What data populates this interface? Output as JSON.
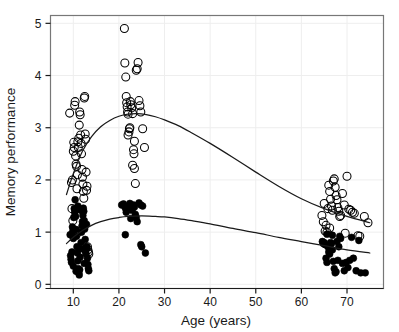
{
  "chart_data": {
    "type": "scatter",
    "title": "",
    "xlabel": "Age (years)",
    "ylabel": "Memory performance",
    "xlim": [
      5,
      78
    ],
    "ylim": [
      -0.08,
      5.15
    ],
    "xticks": [
      10,
      20,
      30,
      40,
      50,
      60,
      70
    ],
    "yticks": [
      0,
      1,
      2,
      3,
      4,
      5
    ],
    "grid": true,
    "legend": "none",
    "background": "#ffffff",
    "frame_color": "#777777",
    "grid_color": "#eeeeee",
    "marker_color": "#000000",
    "curve_color": "#1a1a1a",
    "series": [
      {
        "name": "open-circles",
        "marker": "open-circle",
        "marker_size": 4.0,
        "points": [
          [
            9.2,
            3.28
          ],
          [
            9.6,
            1.95
          ],
          [
            9.7,
            1.45
          ],
          [
            9.8,
            2.0
          ],
          [
            9.9,
            1.22
          ],
          [
            10.0,
            2.55
          ],
          [
            10.1,
            2.72
          ],
          [
            10.2,
            2.62
          ],
          [
            10.3,
            3.43
          ],
          [
            10.4,
            3.5
          ],
          [
            10.5,
            2.46
          ],
          [
            10.6,
            2.3
          ],
          [
            10.7,
            2.26
          ],
          [
            10.8,
            1.83
          ],
          [
            10.9,
            2.1
          ],
          [
            11.0,
            2.73
          ],
          [
            11.1,
            2.62
          ],
          [
            11.2,
            2.8
          ],
          [
            11.3,
            3.05
          ],
          [
            11.4,
            3.3
          ],
          [
            11.5,
            3.25
          ],
          [
            11.6,
            2.86
          ],
          [
            11.7,
            2.7
          ],
          [
            11.8,
            2.5
          ],
          [
            11.9,
            2.2
          ],
          [
            12.0,
            2.05
          ],
          [
            12.1,
            1.92
          ],
          [
            12.2,
            1.78
          ],
          [
            12.3,
            1.65
          ],
          [
            12.4,
            3.57
          ],
          [
            12.5,
            3.6
          ],
          [
            12.6,
            2.88
          ],
          [
            12.7,
            2.78
          ],
          [
            12.8,
            2.15
          ],
          [
            12.9,
            1.8
          ],
          [
            13.0,
            1.88
          ],
          [
            13.1,
            0.72
          ],
          [
            13.2,
            0.66
          ],
          [
            13.3,
            0.62
          ],
          [
            13.4,
            0.58
          ],
          [
            12.2,
            0.72
          ],
          [
            12.6,
            0.67
          ],
          [
            11.0,
            0.99
          ],
          [
            21.2,
            4.9
          ],
          [
            21.3,
            4.24
          ],
          [
            21.5,
            3.97
          ],
          [
            21.6,
            3.6
          ],
          [
            21.7,
            3.48
          ],
          [
            21.8,
            3.4
          ],
          [
            21.9,
            3.3
          ],
          [
            22.0,
            3.26
          ],
          [
            22.2,
            2.92
          ],
          [
            22.3,
            2.98
          ],
          [
            22.4,
            3.0
          ],
          [
            22.5,
            3.5
          ],
          [
            22.6,
            3.44
          ],
          [
            22.8,
            3.38
          ],
          [
            23.0,
            3.27
          ],
          [
            23.2,
            2.58
          ],
          [
            23.3,
            2.5
          ],
          [
            23.4,
            2.22
          ],
          [
            23.6,
            1.93
          ],
          [
            23.0,
            2.28
          ],
          [
            23.4,
            2.74
          ],
          [
            23.8,
            4.1
          ],
          [
            24.0,
            4.13
          ],
          [
            24.2,
            4.25
          ],
          [
            24.4,
            3.52
          ],
          [
            24.6,
            3.42
          ],
          [
            24.8,
            3.3
          ],
          [
            25.2,
            2.98
          ],
          [
            25.6,
            2.62
          ],
          [
            22.0,
            2.86
          ],
          [
            64.5,
            1.32
          ],
          [
            64.8,
            1.2
          ],
          [
            65.0,
            1.55
          ],
          [
            65.2,
            1.02
          ],
          [
            65.4,
            1.13
          ],
          [
            65.6,
            1.0
          ],
          [
            65.8,
            1.45
          ],
          [
            66.0,
            1.9
          ],
          [
            66.2,
            1.78
          ],
          [
            66.4,
            1.63
          ],
          [
            66.6,
            1.5
          ],
          [
            66.8,
            1.42
          ],
          [
            67.0,
            1.98
          ],
          [
            67.2,
            2.02
          ],
          [
            67.4,
            1.86
          ],
          [
            67.6,
            1.7
          ],
          [
            67.8,
            1.62
          ],
          [
            68.0,
            1.47
          ],
          [
            68.2,
            1.4
          ],
          [
            68.4,
            1.3
          ],
          [
            68.6,
            1.32
          ],
          [
            69.0,
            1.74
          ],
          [
            69.4,
            1.52
          ],
          [
            70.0,
            2.07
          ],
          [
            70.4,
            1.44
          ],
          [
            70.8,
            1.42
          ],
          [
            71.2,
            1.38
          ],
          [
            71.6,
            1.36
          ],
          [
            72.4,
            0.93
          ],
          [
            72.8,
            0.92
          ],
          [
            73.8,
            1.3
          ],
          [
            74.6,
            1.18
          ],
          [
            69.6,
            0.98
          ],
          [
            66.2,
            1.08
          ]
        ]
      },
      {
        "name": "filled-circles",
        "marker": "filled-circle",
        "marker_size": 3.4,
        "points": [
          [
            9.3,
            0.95
          ],
          [
            9.4,
            0.55
          ],
          [
            9.5,
            0.48
          ],
          [
            9.6,
            0.42
          ],
          [
            9.7,
            0.62
          ],
          [
            9.8,
            1.1
          ],
          [
            9.9,
            1.02
          ],
          [
            10.0,
            0.88
          ],
          [
            10.1,
            1.28
          ],
          [
            10.2,
            1.45
          ],
          [
            10.3,
            1.38
          ],
          [
            10.4,
            1.62
          ],
          [
            10.5,
            1.3
          ],
          [
            10.6,
            1.05
          ],
          [
            10.7,
            0.92
          ],
          [
            10.8,
            0.72
          ],
          [
            10.9,
            0.6
          ],
          [
            11.0,
            0.45
          ],
          [
            11.1,
            0.3
          ],
          [
            11.2,
            0.22
          ],
          [
            11.3,
            0.18
          ],
          [
            11.4,
            0.28
          ],
          [
            11.5,
            0.52
          ],
          [
            11.6,
            0.68
          ],
          [
            11.7,
            0.8
          ],
          [
            11.8,
            1.0
          ],
          [
            11.9,
            1.12
          ],
          [
            12.0,
            1.2
          ],
          [
            12.1,
            1.32
          ],
          [
            12.2,
            1.46
          ],
          [
            12.3,
            1.4
          ],
          [
            12.4,
            1.22
          ],
          [
            12.5,
            1.06
          ],
          [
            12.6,
            0.86
          ],
          [
            12.7,
            0.62
          ],
          [
            12.8,
            0.58
          ],
          [
            12.9,
            0.68
          ],
          [
            13.0,
            0.72
          ],
          [
            13.1,
            0.5
          ],
          [
            13.2,
            0.38
          ],
          [
            13.3,
            0.3
          ],
          [
            13.4,
            0.26
          ],
          [
            10.0,
            0.35
          ],
          [
            10.6,
            0.25
          ],
          [
            12.4,
            0.4
          ],
          [
            11.0,
            1.5
          ],
          [
            11.6,
            1.42
          ],
          [
            12.9,
            1.15
          ],
          [
            20.6,
            1.52
          ],
          [
            21.0,
            1.54
          ],
          [
            21.4,
            1.46
          ],
          [
            21.6,
            1.38
          ],
          [
            21.8,
            1.44
          ],
          [
            22.0,
            1.5
          ],
          [
            22.2,
            1.48
          ],
          [
            22.4,
            1.55
          ],
          [
            22.6,
            1.5
          ],
          [
            22.8,
            1.42
          ],
          [
            23.0,
            1.46
          ],
          [
            23.2,
            1.52
          ],
          [
            23.4,
            1.48
          ],
          [
            23.6,
            1.34
          ],
          [
            23.8,
            1.28
          ],
          [
            24.0,
            1.2
          ],
          [
            24.4,
            1.56
          ],
          [
            24.8,
            1.52
          ],
          [
            25.2,
            1.5
          ],
          [
            21.4,
            0.95
          ],
          [
            24.8,
            0.76
          ],
          [
            25.0,
            0.72
          ],
          [
            25.8,
            0.6
          ],
          [
            22.6,
            1.26
          ],
          [
            64.6,
            0.82
          ],
          [
            64.8,
            0.78
          ],
          [
            65.0,
            0.8
          ],
          [
            65.2,
            0.76
          ],
          [
            65.4,
            0.5
          ],
          [
            65.6,
            0.42
          ],
          [
            65.8,
            0.72
          ],
          [
            66.0,
            0.62
          ],
          [
            66.2,
            0.58
          ],
          [
            66.4,
            0.8
          ],
          [
            66.6,
            0.78
          ],
          [
            66.8,
            0.66
          ],
          [
            67.0,
            0.44
          ],
          [
            67.2,
            0.3
          ],
          [
            67.4,
            0.22
          ],
          [
            67.6,
            0.24
          ],
          [
            68.0,
            0.46
          ],
          [
            68.4,
            0.92
          ],
          [
            68.6,
            0.88
          ],
          [
            69.0,
            0.4
          ],
          [
            69.4,
            0.26
          ],
          [
            69.8,
            0.42
          ],
          [
            70.2,
            0.32
          ],
          [
            70.6,
            0.46
          ],
          [
            71.0,
            0.9
          ],
          [
            71.4,
            0.5
          ],
          [
            72.0,
            0.26
          ],
          [
            72.6,
            0.84
          ],
          [
            73.0,
            0.22
          ],
          [
            74.0,
            0.22
          ],
          [
            65.6,
            0.96
          ],
          [
            66.8,
            0.94
          ],
          [
            68.2,
            0.72
          ],
          [
            67.8,
            0.82
          ]
        ]
      }
    ],
    "curves": [
      {
        "name": "upper-fit",
        "points": [
          [
            8.5,
            1.72
          ],
          [
            10,
            2.12
          ],
          [
            12,
            2.55
          ],
          [
            14,
            2.83
          ],
          [
            16,
            3.02
          ],
          [
            18,
            3.14
          ],
          [
            20,
            3.22
          ],
          [
            22,
            3.26
          ],
          [
            24,
            3.27
          ],
          [
            26,
            3.25
          ],
          [
            28,
            3.21
          ],
          [
            30,
            3.15
          ],
          [
            33,
            3.04
          ],
          [
            36,
            2.9
          ],
          [
            40,
            2.7
          ],
          [
            45,
            2.43
          ],
          [
            50,
            2.15
          ],
          [
            55,
            1.88
          ],
          [
            60,
            1.64
          ],
          [
            65,
            1.45
          ],
          [
            70,
            1.3
          ],
          [
            75,
            1.18
          ]
        ]
      },
      {
        "name": "lower-fit",
        "points": [
          [
            8.5,
            0.78
          ],
          [
            10,
            0.9
          ],
          [
            12,
            1.03
          ],
          [
            14,
            1.13
          ],
          [
            16,
            1.2
          ],
          [
            18,
            1.25
          ],
          [
            20,
            1.28
          ],
          [
            22,
            1.3
          ],
          [
            25,
            1.31
          ],
          [
            28,
            1.3
          ],
          [
            30,
            1.29
          ],
          [
            33,
            1.26
          ],
          [
            36,
            1.22
          ],
          [
            40,
            1.16
          ],
          [
            45,
            1.07
          ],
          [
            50,
            0.99
          ],
          [
            55,
            0.9
          ],
          [
            60,
            0.82
          ],
          [
            65,
            0.74
          ],
          [
            70,
            0.66
          ],
          [
            75,
            0.6
          ]
        ]
      }
    ]
  }
}
